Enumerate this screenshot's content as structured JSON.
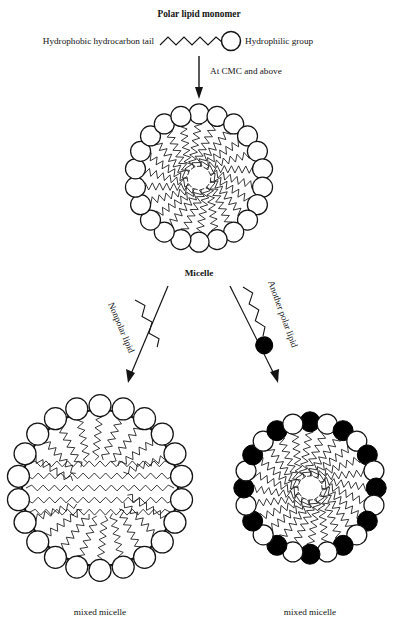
{
  "figure": {
    "title": "Polar lipid monomer",
    "background": "#ffffff",
    "ink": "#141414"
  },
  "monomer": {
    "title": "Polar lipid monomer",
    "tail_label": "Hydrophobic hydrocarbon tail",
    "head_label": "Hydrophilic group",
    "tail_zigzag_peaks": 6,
    "head_fill": "#ffffff",
    "head_stroke": "#141414"
  },
  "transition": {
    "arrow_label": "At CMC and above",
    "arrow_direction": "down"
  },
  "micelle": {
    "label": "Micelle",
    "n_lipids": 22,
    "ring_radius": 60,
    "head_radius": 10,
    "head_fill": "#ffffff",
    "core_type": "radial-zigzag-tails"
  },
  "branches": [
    {
      "name": "nonpolar-lipid",
      "label": "Nonpolar lipid",
      "side": "left",
      "lipid_has_head": false,
      "head_fill": null
    },
    {
      "name": "another-polar-lipid",
      "label": "Another polar lipid",
      "side": "right",
      "lipid_has_head": true,
      "head_fill": "#000000"
    }
  ],
  "products": [
    {
      "name": "mixed-micelle-nonpolar",
      "label": "mixed micelle",
      "n_lipids": 22,
      "ring_radius": 78,
      "head_radius": 11,
      "head_fill": "#ffffff",
      "core_type": "swollen-core-with-horizontal-chains",
      "horizontal_chain_rows": 5
    },
    {
      "name": "mixed-micelle-polar",
      "label": "mixed micelle",
      "n_lipids": 24,
      "ring_radius": 62,
      "head_radius": 10,
      "head_fill_alternating": [
        "#000000",
        "#ffffff"
      ],
      "core_type": "radial-zigzag-tails"
    }
  ]
}
